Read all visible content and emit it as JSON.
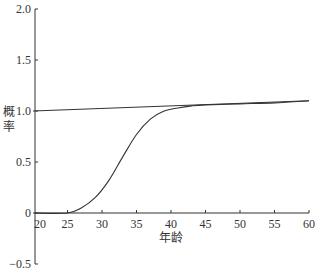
{
  "chart_data": {
    "type": "line",
    "title": "",
    "xlabel": "年龄",
    "ylabel": "概率",
    "xlim": [
      20,
      60
    ],
    "ylim": [
      -0.5,
      2.0
    ],
    "x_ticks": [
      "20",
      "25",
      "30",
      "35",
      "40",
      "45",
      "50",
      "55",
      "60"
    ],
    "y_ticks": [
      "-0.5",
      "0",
      "0.5",
      "1.0",
      "1.5",
      "2.0"
    ],
    "grid": false,
    "legend": null,
    "series": [
      {
        "name": "linear",
        "x": [
          20,
          60
        ],
        "y": [
          1.0,
          1.1
        ]
      },
      {
        "name": "sigmoid",
        "x": [
          20,
          25,
          27,
          29,
          31,
          33,
          35,
          37,
          39,
          41,
          43,
          45,
          50,
          55,
          60
        ],
        "y": [
          0.0,
          0.0,
          0.05,
          0.15,
          0.32,
          0.55,
          0.77,
          0.92,
          1.0,
          1.03,
          1.05,
          1.06,
          1.07,
          1.08,
          1.1
        ]
      }
    ]
  },
  "colors": {
    "axis": "#333333",
    "line": "#333333"
  }
}
